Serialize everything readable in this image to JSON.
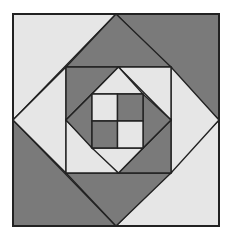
{
  "colors": {
    "light": "#e6e6e6",
    "dark": "#7a7a7a",
    "stroke": "#222222",
    "background": "#ffffff"
  },
  "geometry": {
    "outer_square": {
      "x1": 13,
      "y1": 14,
      "x2": 219,
      "y2": 226
    },
    "middle_square": {
      "x1": 66,
      "y1": 67,
      "x2": 171,
      "y2": 173
    },
    "inner_square": {
      "x1": 92,
      "y1": 94,
      "x2": 143,
      "y2": 148
    }
  },
  "regions": {
    "outer_corners": {
      "top_left": "light",
      "top_right": "dark",
      "bottom_right": "light",
      "bottom_left": "dark"
    },
    "outer_diamond_ring": {
      "top": "dark",
      "right": "light",
      "bottom": "dark",
      "left": "light"
    },
    "middle_corners": {
      "top_left": "dark",
      "top_right": "light",
      "bottom_right": "dark",
      "bottom_left": "light"
    },
    "inner_diamond_ring": {
      "top": "light",
      "right": "dark",
      "bottom": "light",
      "left": "dark"
    },
    "center_quad": {
      "top_left": "light",
      "top_right": "dark",
      "bottom_left": "dark",
      "bottom_right": "light"
    }
  }
}
